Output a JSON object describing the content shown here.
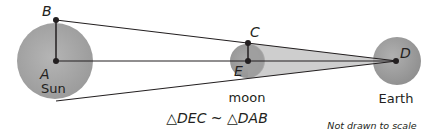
{
  "diagram": {
    "points": {
      "A": {
        "label": "A",
        "x": 56,
        "y": 61
      },
      "B": {
        "label": "B",
        "x": 56,
        "y": 20
      },
      "C": {
        "label": "C",
        "x": 248,
        "y": 43
      },
      "D": {
        "label": "D",
        "x": 397,
        "y": 61
      },
      "E": {
        "label": "E",
        "x": 248,
        "y": 61
      }
    },
    "bodies": {
      "sun": {
        "name": "Sun",
        "cx": 55,
        "cy": 61,
        "r": 38
      },
      "moon": {
        "name": "moon",
        "cx": 247,
        "cy": 61,
        "r": 17
      },
      "earth": {
        "name": "Earth",
        "cx": 397,
        "cy": 61,
        "r": 24
      }
    },
    "similarity_statement": "△DEC ~ △DAB",
    "note": "Not drawn to scale",
    "colors": {
      "body_fill": "#a6a6a6",
      "shadow_wedge": "#bdbdbd",
      "line": "#231f20",
      "text": "#231f20"
    }
  }
}
